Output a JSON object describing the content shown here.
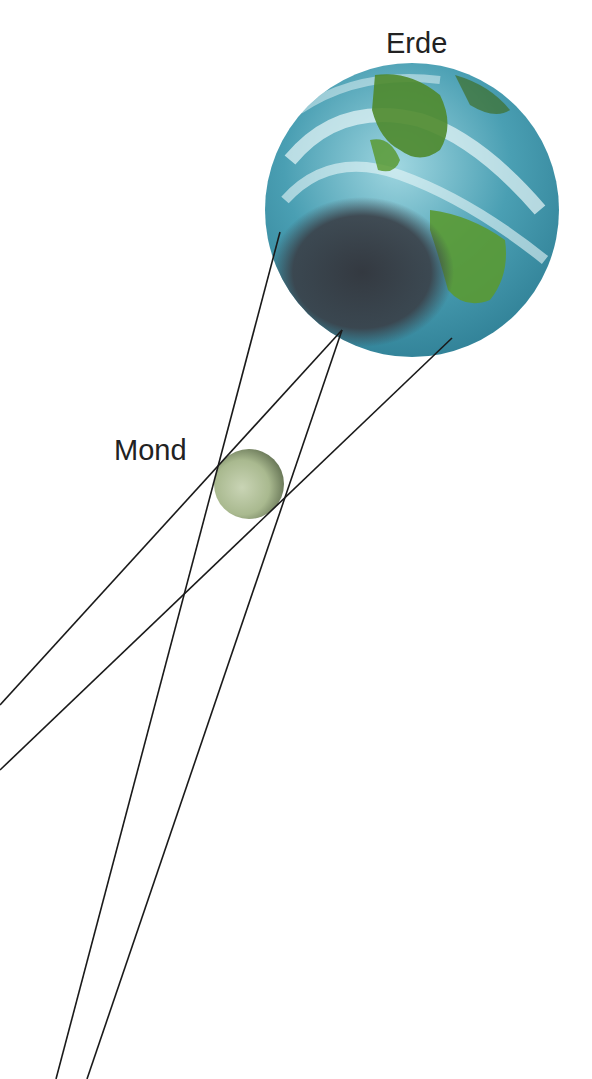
{
  "labels": {
    "earth": "Erde",
    "moon": "Mond"
  },
  "colors": {
    "ocean": "#3f95a8",
    "ocean_light": "#8fd0dd",
    "land": "#4f8a2c",
    "shadow": "#3a3f47",
    "moon": "#aebf96",
    "moon_dark": "#5f6d4f",
    "lines": "#1a1a1a",
    "text": "#222222"
  },
  "bodies": {
    "earth": {
      "cx": 412,
      "cy": 210,
      "r": 147
    },
    "moon": {
      "cx": 249,
      "cy": 484,
      "r": 35
    }
  },
  "lines": [
    {
      "x1": 280,
      "y1": 232,
      "x2": 56,
      "y2": 1079
    },
    {
      "x1": 342,
      "y1": 330,
      "x2": 0,
      "y2": 705
    },
    {
      "x1": 342,
      "y1": 330,
      "x2": 87,
      "y2": 1079
    },
    {
      "x1": 452,
      "y1": 338,
      "x2": 0,
      "y2": 770
    }
  ]
}
